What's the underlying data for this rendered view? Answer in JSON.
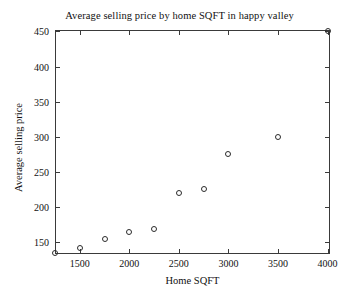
{
  "chart_data": {
    "type": "scatter",
    "title": "Average selling price by home SQFT in happy valley",
    "xlabel": "Home SQFT",
    "ylabel": "Average selling price",
    "xlim": [
      1250,
      4025
    ],
    "ylim": [
      133,
      452
    ],
    "grid": false,
    "legend": null,
    "marker": "open-circle",
    "marker_color": "#2b2b2b",
    "xticks": [
      1500,
      2000,
      2500,
      3000,
      3500,
      4000
    ],
    "xticklabels": [
      "1500",
      "2000",
      "2500",
      "3000",
      "3500",
      "4000"
    ],
    "yticks": [
      150,
      200,
      250,
      300,
      350,
      400,
      450
    ],
    "yticklabels": [
      "150",
      "200",
      "250",
      "300",
      "350",
      "400",
      "450"
    ],
    "x": [
      1250,
      1500,
      1750,
      2000,
      2250,
      2500,
      2750,
      3000,
      3500,
      4000
    ],
    "y": [
      135,
      141,
      154,
      164,
      169,
      220,
      225,
      275,
      300,
      450
    ],
    "points": [
      {
        "x": 1250,
        "y": 135
      },
      {
        "x": 1500,
        "y": 141
      },
      {
        "x": 1750,
        "y": 154
      },
      {
        "x": 2000,
        "y": 164
      },
      {
        "x": 2250,
        "y": 169
      },
      {
        "x": 2500,
        "y": 220
      },
      {
        "x": 2750,
        "y": 225
      },
      {
        "x": 3000,
        "y": 275
      },
      {
        "x": 3500,
        "y": 300
      },
      {
        "x": 4000,
        "y": 450
      }
    ]
  }
}
